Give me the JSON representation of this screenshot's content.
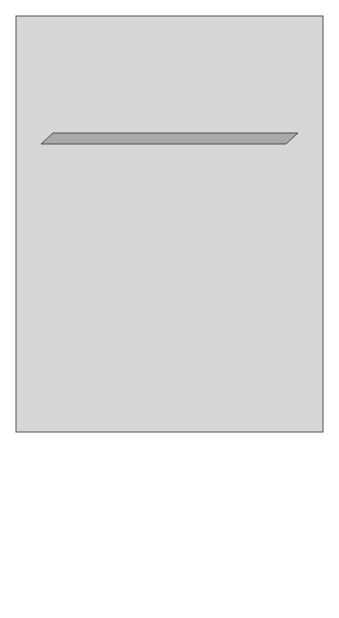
{
  "diagram": {
    "begin": "Begin",
    "hypothalamus": "HYPOTHALAMUS",
    "gnrh": "GnRH",
    "anterior_pituitary": "ANTERIOR PITUITARY",
    "fsh_only": "(FSH) ONLY",
    "fsh": "FSH",
    "lh": "LH",
    "ovaries": "Ovaries",
    "granulosa": [
      "GRANULOSA",
      "CELLS"
    ],
    "theca": [
      "THECA",
      "CELLS"
    ],
    "androgens": "ANDROGENS",
    "facilitate": [
      "FACILITATE",
      "OOGENESIS"
    ],
    "estrogen_inner": "ESTROGEN",
    "inhibin": "INHIBIN",
    "estrogen_out": "ESTROGEN",
    "reproductive": [
      "REPRODUCTIVE TRACT",
      "AND",
      "OTHER ORGANS"
    ],
    "question": "?",
    "minus": "−",
    "plus": "+"
  },
  "colors": {
    "panel": "#d7d7d7",
    "box_front": "#c9c9c9",
    "box_top": "#a9a9a9",
    "box_side": "#9a9a9a",
    "label_box": "#9b9b9b",
    "inner_box": "#e9e9e9",
    "ovary_front": "#c2c2c2",
    "stroke": "#2a2a2a"
  }
}
